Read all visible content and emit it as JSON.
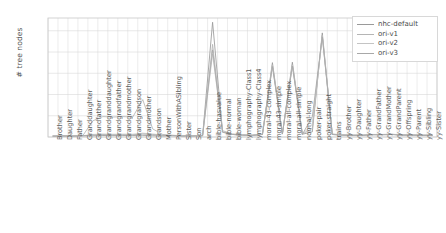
{
  "chart_data": {
    "type": "line",
    "title": "",
    "xlabel": "",
    "ylabel": "# tree nodes",
    "ylim": [
      0,
      2800
    ],
    "yticks": [
      0,
      500,
      1000,
      1500,
      2000,
      2500
    ],
    "ytick_labels": [
      "0",
      "500",
      "1000",
      "1500",
      "2000",
      "2500"
    ],
    "grid": true,
    "legend_position": "upper right",
    "categories": [
      "Brother",
      "Daughter",
      "Father",
      "Granddaughter",
      "Grandfather",
      "Grandgranddaughter",
      "Grandgrandfather",
      "Grandgrandmother",
      "Grandgrandson",
      "Grandmother",
      "Grandson",
      "Mother",
      "PersonWithASibling",
      "Sister",
      "Son",
      "arch",
      "bible-hasvalue",
      "bible-normal",
      "bible-woman",
      "lymphography-Class1",
      "lymphography-Class4",
      "moral-43-complex",
      "moral-43-simple",
      "moral-all-complex",
      "moral-all-simple",
      "normal-long",
      "poker-pair",
      "poker-straight",
      "trains",
      "yy-Brother",
      "yy-Daughter",
      "yy-Father",
      "yy-GrandFather",
      "yy-GrandMother",
      "yy-GrandParent",
      "yy-Offspring",
      "yy-Parent",
      "yy-Sibling",
      "yy-Sister"
    ],
    "series": [
      {
        "name": "nhc-default",
        "color": "#9a9a9a",
        "values": [
          20,
          25,
          20,
          30,
          28,
          35,
          33,
          34,
          36,
          40,
          30,
          25,
          30,
          22,
          25,
          30,
          2700,
          120,
          60,
          45,
          40,
          60,
          1750,
          70,
          1760,
          65,
          120,
          2450,
          60,
          45,
          40,
          40,
          55,
          55,
          60,
          45,
          45,
          40,
          40
        ]
      },
      {
        "name": "ori-v1",
        "color": "#b5b5b5",
        "values": [
          25,
          30,
          28,
          35,
          380,
          480,
          470,
          480,
          470,
          880,
          190,
          60,
          40,
          30,
          28,
          35,
          2180,
          150,
          70,
          50,
          45,
          70,
          1700,
          80,
          1700,
          70,
          200,
          2400,
          70,
          50,
          45,
          45,
          60,
          60,
          65,
          50,
          50,
          45,
          45
        ]
      },
      {
        "name": "ori-v2",
        "color": "#c4c4c4",
        "values": [
          22,
          26,
          24,
          30,
          60,
          70,
          65,
          68,
          66,
          90,
          70,
          45,
          38,
          26,
          26,
          32,
          1950,
          130,
          65,
          48,
          42,
          65,
          1680,
          75,
          1690,
          68,
          300,
          2380,
          65,
          48,
          42,
          42,
          58,
          58,
          62,
          48,
          48,
          42,
          42
        ]
      },
      {
        "name": "ori-v3",
        "color": "#a8a8a8",
        "values": [
          20,
          24,
          22,
          28,
          45,
          55,
          50,
          52,
          50,
          70,
          55,
          40,
          34,
          24,
          24,
          30,
          2050,
          110,
          58,
          44,
          38,
          58,
          1660,
          68,
          1670,
          60,
          480,
          2360,
          58,
          44,
          38,
          38,
          52,
          52,
          56,
          44,
          44,
          38,
          38
        ]
      }
    ]
  },
  "legend": {
    "entries": [
      {
        "label": "nhc-default"
      },
      {
        "label": "ori-v1"
      },
      {
        "label": "ori-v2"
      },
      {
        "label": "ori-v3"
      }
    ]
  }
}
